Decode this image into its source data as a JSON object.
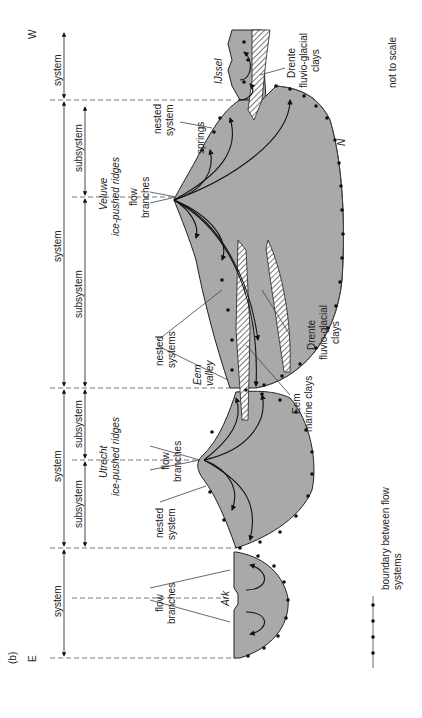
{
  "figure": {
    "panel_label": "(b)",
    "orientation_left": "E",
    "orientation_right": "W",
    "scale_note": "not to scale",
    "colors": {
      "flow_region": "#a9a9a9",
      "lines": "#222222",
      "dashed_guides": "#777777"
    }
  },
  "dimension_rows": {
    "systems": [
      {
        "label": "system",
        "segment": "E-end (Ark)"
      },
      {
        "label": "system",
        "segment": "Utrecht"
      },
      {
        "label": "system",
        "segment": "Veluwe"
      },
      {
        "label": "system",
        "segment": "W-end (IJssel)"
      }
    ],
    "subsystems": [
      {
        "label": "subsystem",
        "segment": "Utrecht east"
      },
      {
        "label": "subsystem",
        "segment": "Utrecht west"
      },
      {
        "label": "subsystem",
        "segment": "Veluwe east"
      },
      {
        "label": "subsystem",
        "segment": "Veluwe west"
      }
    ]
  },
  "ridges": [
    {
      "name": "Veluwe",
      "sub": "ice-pushed ridges"
    },
    {
      "name": "Utrecht",
      "sub": "ice-pushed ridges"
    }
  ],
  "annotations": {
    "flow_branches_veluwe": [
      "flow",
      "branches"
    ],
    "flow_branches_utrecht": [
      "flow",
      "branches"
    ],
    "flow_branches_ark": [
      "flow",
      "branches"
    ],
    "nested_system_veluwe": [
      "nested",
      "system"
    ],
    "springs": "springs",
    "nested_systems_eem": [
      "nested",
      "systems"
    ],
    "eem_valley": [
      "Eem",
      "valley"
    ],
    "nested_system_utrecht": [
      "nested",
      "system"
    ],
    "ark": "Ark",
    "ijssel": "IJssel",
    "drente_clays_west": [
      "Drente",
      "fluvio-glacial",
      "clays"
    ],
    "drente_clays_eem": [
      "Drente",
      "fluvio-glacial",
      "clays"
    ],
    "eem_marine_clays": [
      "Eem",
      "marine clays"
    ],
    "n_marker": "N"
  },
  "legend": {
    "label_line1": "boundary between flow",
    "label_line2": "systems",
    "symbol": "dotted-line"
  }
}
